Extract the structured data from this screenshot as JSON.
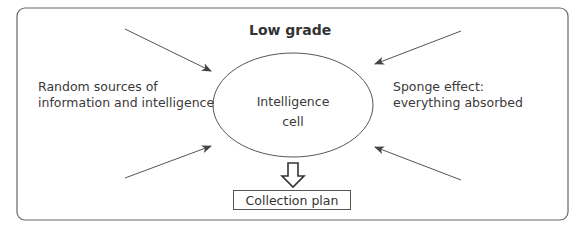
{
  "diagram": {
    "title": "Low grade",
    "center_node": {
      "line1": "Intelligence",
      "line2": "cell"
    },
    "left_label": {
      "line1": "Random sources of",
      "line2": "information and intelligence"
    },
    "right_label": {
      "line1": "Sponge effect:",
      "line2": "everything absorbed"
    },
    "output_box": "Collection plan",
    "colors": {
      "stroke": "#555555",
      "text": "#333333",
      "background": "#ffffff"
    }
  }
}
